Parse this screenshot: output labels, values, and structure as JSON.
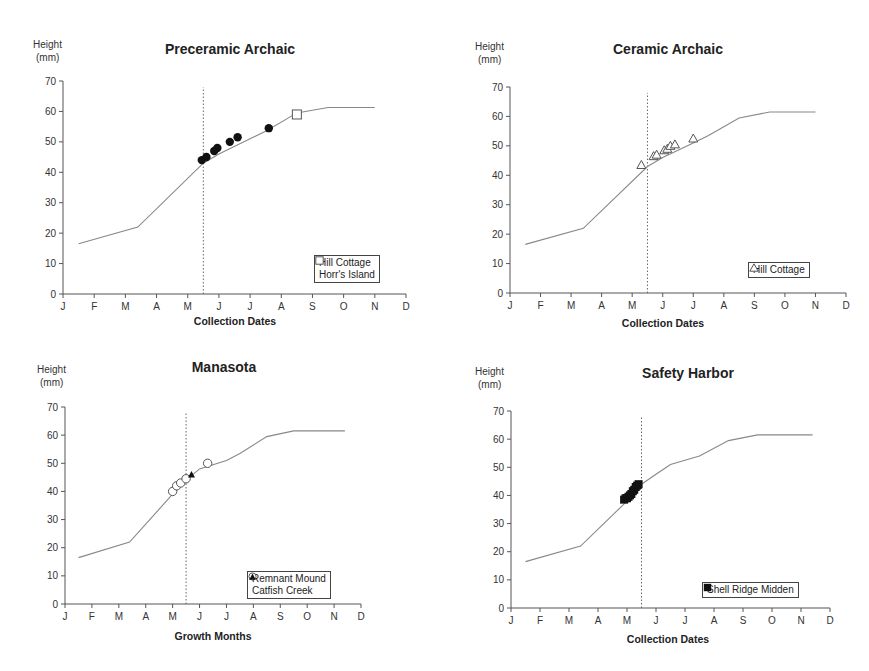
{
  "chart_data": [
    {
      "type": "line",
      "title": "Preceramic Archaic",
      "ylabel": "Height (mm)",
      "xlabel": "Collection Dates",
      "x_tick_labels": [
        "J",
        "F",
        "M",
        "A",
        "M",
        "J",
        "J",
        "A",
        "S",
        "O",
        "N",
        "D"
      ],
      "y_ticks": [
        0,
        10,
        20,
        30,
        40,
        50,
        60,
        70
      ],
      "ylim": [
        0,
        70
      ],
      "grid": false,
      "legend_position": "lower right",
      "reference_line_month": 4.5,
      "growth_curve": {
        "x": [
          0.5,
          2.4,
          4.5,
          5.0,
          6.0,
          6.5,
          7.5,
          8.5,
          10.0
        ],
        "y": [
          16.5,
          22,
          43,
          46,
          51,
          53.5,
          59.5,
          61.3,
          61.3
        ]
      },
      "series": [
        {
          "name": "Hill Cottage",
          "marker": "filled-circle",
          "x": [
            4.45,
            4.6,
            4.85,
            4.95,
            5.35,
            5.6,
            6.6
          ],
          "y": [
            44,
            45,
            47,
            48,
            50,
            51.5,
            54.5
          ]
        },
        {
          "name": "Horr's Island",
          "marker": "open-square",
          "x": [
            7.5
          ],
          "y": [
            59
          ]
        }
      ]
    },
    {
      "type": "line",
      "title": "Ceramic Archaic",
      "ylabel": "Height (mm)",
      "xlabel": "Collection Dates",
      "x_tick_labels": [
        "J",
        "F",
        "M",
        "A",
        "M",
        "J",
        "J",
        "A",
        "S",
        "O",
        "N",
        "D"
      ],
      "y_ticks": [
        0,
        10,
        20,
        30,
        40,
        50,
        60,
        70
      ],
      "ylim": [
        0,
        70
      ],
      "grid": false,
      "legend_position": "lower right",
      "reference_line_month": 4.5,
      "growth_curve": {
        "x": [
          0.5,
          2.4,
          4.5,
          5.0,
          6.0,
          6.5,
          7.5,
          8.5,
          10.0
        ],
        "y": [
          16.5,
          22,
          43,
          46,
          51,
          53.5,
          59.5,
          61.5,
          61.5
        ]
      },
      "series": [
        {
          "name": "Hill Cottage",
          "marker": "open-triangle",
          "x": [
            4.3,
            4.7,
            4.8,
            5.05,
            5.15,
            5.25,
            5.4,
            6.0
          ],
          "y": [
            43.5,
            46.5,
            47,
            48.5,
            49,
            50,
            50.5,
            52.5
          ]
        }
      ]
    },
    {
      "type": "line",
      "title": "Manasota",
      "ylabel": "Height (mm)",
      "xlabel": "Growth Months",
      "x_tick_labels": [
        "J",
        "F",
        "M",
        "A",
        "M",
        "J",
        "J",
        "A",
        "S",
        "O",
        "N",
        "D"
      ],
      "y_ticks": [
        0,
        10,
        20,
        30,
        40,
        50,
        60,
        70
      ],
      "ylim": [
        0,
        70
      ],
      "grid": false,
      "legend_position": "lower right",
      "reference_line_month": 4.5,
      "growth_curve": {
        "x": [
          0.5,
          2.4,
          4.0,
          4.5,
          5.0,
          6.0,
          6.5,
          7.5,
          8.5,
          10.4
        ],
        "y": [
          16.5,
          22,
          39,
          44,
          48,
          51,
          53.5,
          59.5,
          61.5,
          61.5
        ]
      },
      "series": [
        {
          "name": "Remnant Mound",
          "marker": "open-circle",
          "x": [
            4.0,
            4.15,
            4.3,
            4.5,
            5.3
          ],
          "y": [
            40,
            42,
            43,
            44.5,
            50
          ]
        },
        {
          "name": "Catfish Creek",
          "marker": "filled-triangle",
          "x": [
            4.7
          ],
          "y": [
            46
          ]
        }
      ]
    },
    {
      "type": "line",
      "title": "Safety Harbor",
      "ylabel": "Height (mm)",
      "xlabel": "Collection Dates",
      "x_tick_labels": [
        "J",
        "F",
        "M",
        "A",
        "M",
        "J",
        "J",
        "A",
        "S",
        "O",
        "N",
        "D"
      ],
      "y_ticks": [
        0,
        10,
        20,
        30,
        40,
        50,
        60,
        70
      ],
      "ylim": [
        0,
        70
      ],
      "grid": false,
      "legend_position": "lower right",
      "reference_line_month": 4.5,
      "growth_curve": {
        "x": [
          0.5,
          2.4,
          4.0,
          4.5,
          5.0,
          5.5,
          6.0,
          6.5,
          7.5,
          8.5,
          10.4
        ],
        "y": [
          16.5,
          22,
          38,
          44,
          47.5,
          51,
          52.5,
          54,
          59.5,
          61.5,
          61.5
        ]
      },
      "series": [
        {
          "name": "Shell Ridge Midden",
          "marker": "filled-square",
          "x": [
            3.9,
            3.95,
            4.0,
            4.05,
            4.1,
            4.15,
            4.2,
            4.25,
            4.3,
            4.35,
            4.4
          ],
          "y": [
            38.5,
            39,
            39,
            39.5,
            40,
            40.5,
            41.5,
            42,
            43,
            43.5,
            44
          ]
        }
      ]
    }
  ],
  "labels": {
    "height": "Height",
    "mm": "(mm)"
  }
}
